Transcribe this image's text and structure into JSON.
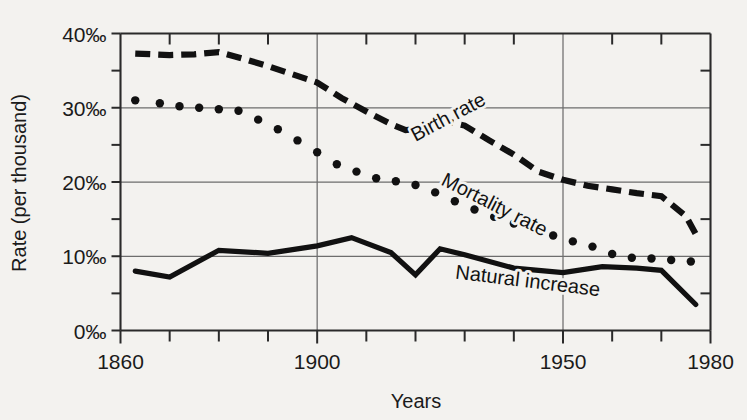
{
  "chart_data": {
    "type": "line",
    "title": "",
    "xlabel": "Years",
    "ylabel": "Rate (per thousand)",
    "xlim": [
      1860,
      1980
    ],
    "ylim": [
      0,
      40
    ],
    "x_ticks_major": [
      1860,
      1900,
      1950,
      1980
    ],
    "x_ticks_major_labels": [
      "1860",
      "1900",
      "1950",
      "1980"
    ],
    "x_ticks_minor": [
      1870,
      1880,
      1890,
      1910,
      1920,
      1930,
      1940,
      1960,
      1970
    ],
    "x_gridlines": [
      1900,
      1950
    ],
    "y_ticks_major": [
      0,
      10,
      20,
      30,
      40
    ],
    "y_ticks_major_labels": [
      "0‰",
      "10‰",
      "20‰",
      "30‰",
      "40‰"
    ],
    "y_ticks_minor": [
      5,
      15,
      25,
      35
    ],
    "y_gridlines": [
      10,
      20,
      30
    ],
    "grid": true,
    "legend": "inline-labels",
    "series": [
      {
        "name": "Birth rate",
        "style": "dashed",
        "label_x": 1920,
        "label_y": 25.4,
        "label_rotation": -28,
        "x": [
          1863,
          1870,
          1875,
          1880,
          1885,
          1890,
          1895,
          1900,
          1905,
          1910,
          1915,
          1918,
          1920,
          1925,
          1930,
          1935,
          1940,
          1945,
          1950,
          1955,
          1960,
          1965,
          1970,
          1975,
          1977
        ],
        "values": [
          37.3,
          37.1,
          37.2,
          37.5,
          36.6,
          35.6,
          34.5,
          33.4,
          31.3,
          29.5,
          27.8,
          27.0,
          27.1,
          28.4,
          27.6,
          25.6,
          23.7,
          21.4,
          20.3,
          19.5,
          19.0,
          18.5,
          18.1,
          15.4,
          13.0
        ]
      },
      {
        "name": "Mortality rate",
        "style": "dotted",
        "label_x": 1925,
        "label_y": 19.7,
        "label_rotation": 27,
        "x": [
          1863,
          1868,
          1872,
          1876,
          1880,
          1884,
          1888,
          1892,
          1896,
          1900,
          1904,
          1908,
          1912,
          1916,
          1920,
          1924,
          1928,
          1932,
          1936,
          1940,
          1944,
          1948,
          1952,
          1956,
          1960,
          1964,
          1968,
          1972,
          1976
        ],
        "values": [
          31.0,
          30.6,
          30.2,
          30.0,
          29.8,
          29.6,
          28.4,
          27.1,
          25.6,
          24.0,
          22.4,
          21.4,
          20.5,
          20.1,
          19.6,
          18.6,
          17.4,
          16.3,
          15.3,
          14.4,
          13.6,
          12.8,
          12.0,
          11.3,
          10.3,
          9.8,
          9.7,
          9.5,
          9.3
        ]
      },
      {
        "name": "Natural increase",
        "style": "solid",
        "label_x": 1928,
        "label_y": 7.0,
        "label_rotation": 7,
        "x": [
          1863,
          1870,
          1880,
          1890,
          1900,
          1907,
          1915,
          1920,
          1925,
          1930,
          1940,
          1950,
          1958,
          1965,
          1970,
          1977
        ],
        "values": [
          8.0,
          7.2,
          10.8,
          10.4,
          11.4,
          12.5,
          10.5,
          7.5,
          11.0,
          10.2,
          8.4,
          7.8,
          8.6,
          8.4,
          8.1,
          3.5
        ]
      }
    ]
  },
  "axis": {
    "y_label": "Rate (per thousand)",
    "x_label": "Years"
  }
}
